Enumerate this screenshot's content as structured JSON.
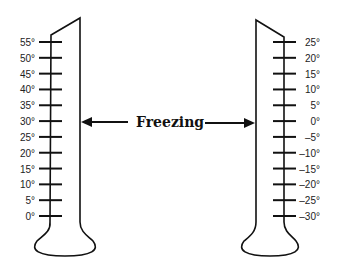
{
  "diagram": {
    "freezing_label": "Freezing",
    "left_thermometer": {
      "scale": "Fahrenheit-like",
      "labels": [
        "55°",
        "50°",
        "45°",
        "40°",
        "35°",
        "30°",
        "25°",
        "20°",
        "15°",
        "10°",
        "5°",
        "0°"
      ],
      "freezing_mark": "30°"
    },
    "right_thermometer": {
      "scale": "Celsius-like",
      "labels": [
        "25°",
        "20°",
        "15°",
        "10°",
        "5°",
        "0°",
        "-5°",
        "-10°",
        "-15°",
        "-20°",
        "-25°",
        "-30°"
      ],
      "freezing_mark": "0°"
    },
    "colors": {
      "line": "#111111",
      "background": "#ffffff"
    }
  }
}
